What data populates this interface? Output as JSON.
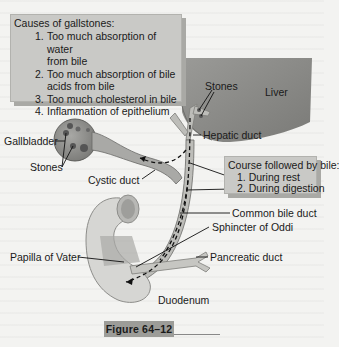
{
  "causes_box": {
    "title": "Causes of gallstones:",
    "items": [
      {
        "num": "1.",
        "text": "Too much absorption of water"
      },
      {
        "num": "",
        "text": "from bile"
      },
      {
        "num": "2.",
        "text": "Too much absorption of bile"
      },
      {
        "num": "",
        "text": "acids from bile"
      },
      {
        "num": "3.",
        "text": "Too much cholesterol in bile"
      },
      {
        "num": "4.",
        "text": "Inflammation of epithelium"
      }
    ]
  },
  "course_box": {
    "title": "Course followed by bile:",
    "items": [
      "1. During rest",
      "2. During digestion"
    ]
  },
  "labels": {
    "stones_top": "Stones",
    "liver": "Liver",
    "hepatic_duct": "Hepatic duct",
    "gallbladder": "Gallbladder",
    "stones_left": "Stones",
    "cystic_duct": "Cystic duct",
    "common_bile_duct": "Common bile duct",
    "sphincter_of_oddi": "Sphincter of Oddi",
    "papilla_of_vater": "Papilla of Vater",
    "pancreatic_duct": "Pancreatic duct",
    "duodenum": "Duodenum"
  },
  "figure_caption": "Figure 64–12",
  "colors": {
    "liver": "#8a8a87",
    "box_fill": "#c9c9c6",
    "duct": "#b8b8b4",
    "duodenum": "#d6d6d3",
    "caption_bg": "#9c9c98"
  }
}
